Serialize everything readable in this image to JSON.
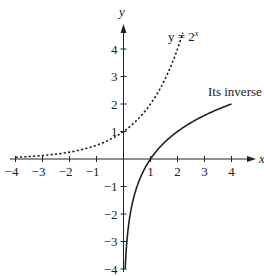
{
  "chart_data": {
    "type": "line",
    "title": "",
    "xlabel": "x",
    "ylabel": "y",
    "xlim": [
      -4,
      4.5
    ],
    "ylim": [
      -4,
      4.5
    ],
    "grid": false,
    "legend": null,
    "x_ticks": [
      -4,
      -3,
      -2,
      -1,
      1,
      2,
      3,
      4
    ],
    "x_tick_labels": [
      "−4",
      "−3",
      "−2",
      "−1",
      "1",
      "2",
      "3",
      "4"
    ],
    "y_ticks": [
      4,
      3,
      2,
      1,
      -1,
      -2,
      -3,
      -4
    ],
    "y_tick_labels": [
      "4",
      "3",
      "2",
      "1",
      "−1",
      "−2",
      "−3",
      "−4"
    ],
    "series": [
      {
        "name": "y = 2^x",
        "style": "dashed",
        "function": "2^x",
        "x": [
          -4,
          -3,
          -2,
          -1,
          0,
          0.5,
          1,
          1.5,
          2,
          2.2
        ],
        "values": [
          0.0625,
          0.125,
          0.25,
          0.5,
          1,
          1.414,
          2,
          2.828,
          4,
          4.59
        ]
      },
      {
        "name": "Its inverse",
        "style": "solid",
        "function": "log2(x)",
        "x": [
          0.0625,
          0.125,
          0.25,
          0.5,
          1,
          1.5,
          2,
          3,
          4
        ],
        "values": [
          -4,
          -3,
          -2,
          -1,
          0,
          0.585,
          1,
          1.585,
          2
        ]
      }
    ],
    "annotations": [
      {
        "text": "y = 2",
        "superscript": "x",
        "near": "dashed curve top"
      },
      {
        "text": "Its inverse",
        "near": "solid curve right end"
      }
    ]
  },
  "labels": {
    "x_axis": "x",
    "y_axis": "y",
    "exp_curve_base": "y = 2",
    "exp_curve_sup": "x",
    "inverse_curve": "Its inverse"
  },
  "ticks": {
    "x": [
      "−4",
      "−3",
      "−2",
      "−1",
      "1",
      "2",
      "3",
      "4"
    ],
    "y": [
      "4",
      "3",
      "2",
      "1",
      "−1",
      "−2",
      "−3",
      "−4"
    ]
  }
}
